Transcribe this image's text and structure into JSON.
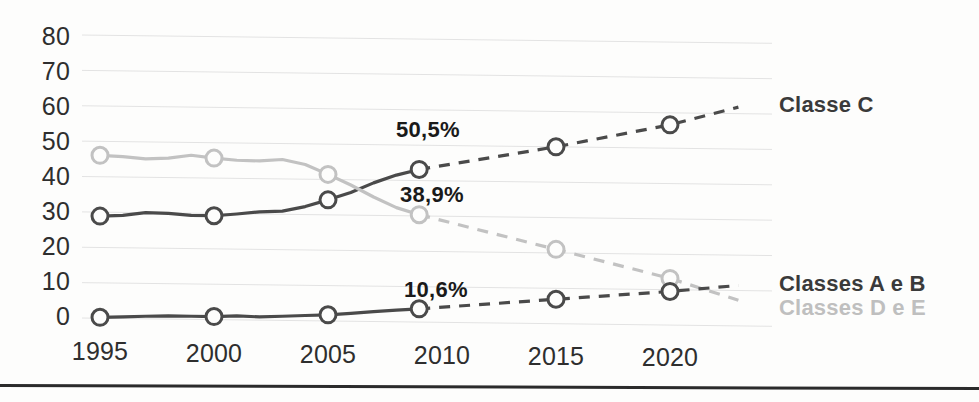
{
  "chart_data": {
    "type": "line",
    "title": "",
    "subtitle": "",
    "xlabel": "",
    "ylabel": "",
    "xlim": [
      1994,
      2024
    ],
    "ylim": [
      0,
      80
    ],
    "grid": true,
    "legend_position": "right",
    "x_tick_labels": [
      "1995",
      "2000",
      "2005",
      "2010",
      "2015",
      "2020"
    ],
    "x_ticks": [
      1995,
      2000,
      2005,
      2010,
      2015,
      2020
    ],
    "y_tick_labels": [
      "0",
      "10",
      "20",
      "30",
      "40",
      "50",
      "60",
      "70",
      "80"
    ],
    "y_ticks": [
      0,
      10,
      20,
      30,
      40,
      50,
      60,
      70,
      80
    ],
    "series": [
      {
        "name": "Classe C",
        "color": "#4a4a4a",
        "style": "solid-then-dashed",
        "solid_x": [
          1995,
          1996,
          1997,
          1998,
          1999,
          2000,
          2001,
          2002,
          2003,
          2004,
          2005,
          2006,
          2007,
          2008,
          2009
        ],
        "solid_y": [
          28.8,
          29.0,
          29.8,
          29.6,
          29.0,
          28.9,
          29.4,
          30.0,
          30.2,
          31.5,
          33.4,
          35.5,
          38.2,
          40.4,
          42.0
        ],
        "dashed_x": [
          2009,
          2015,
          2020,
          2023
        ],
        "dashed_y": [
          42.0,
          48.4,
          54.6,
          59.6
        ],
        "marker_x": [
          1995,
          2000,
          2005,
          2009,
          2015,
          2020
        ],
        "marker_y": [
          28.8,
          28.9,
          33.4,
          42.0,
          48.4,
          54.6
        ]
      },
      {
        "name": "Classes D e E",
        "color": "#c2c2c2",
        "style": "solid-then-dashed",
        "solid_x": [
          1995,
          1996,
          1997,
          1998,
          1999,
          2000,
          2001,
          2002,
          2003,
          2004,
          2005,
          2006,
          2007,
          2008,
          2009
        ],
        "solid_y": [
          46.0,
          45.6,
          45.0,
          45.2,
          46.0,
          45.2,
          44.6,
          44.4,
          44.8,
          43.4,
          40.6,
          37.6,
          34.2,
          31.2,
          29.2
        ],
        "dashed_x": [
          2009,
          2015,
          2020,
          2023
        ],
        "dashed_y": [
          29.2,
          19.4,
          11.2,
          5.0
        ],
        "marker_x": [
          1995,
          2000,
          2005,
          2009,
          2015,
          2020
        ],
        "marker_y": [
          46.0,
          45.2,
          40.6,
          29.2,
          19.4,
          11.2
        ]
      },
      {
        "name": "Classes A e B",
        "color": "#4a4a4a",
        "style": "solid-then-dashed",
        "solid_x": [
          1995,
          1996,
          1997,
          1998,
          1999,
          2000,
          2001,
          2002,
          2003,
          2004,
          2005,
          2006,
          2007,
          2008,
          2009
        ],
        "solid_y": [
          0.2,
          0.3,
          0.5,
          0.6,
          0.5,
          0.4,
          0.6,
          0.3,
          0.5,
          0.7,
          0.9,
          1.3,
          1.8,
          2.2,
          2.6
        ],
        "dashed_x": [
          2009,
          2015,
          2020,
          2023
        ],
        "dashed_y": [
          2.6,
          5.3,
          7.5,
          9.2
        ],
        "marker_x": [
          1995,
          2000,
          2005,
          2009,
          2015,
          2020
        ],
        "marker_y": [
          0.2,
          0.4,
          0.9,
          2.6,
          5.3,
          7.5
        ]
      }
    ],
    "annotations": [
      {
        "text": "50,5%",
        "series": "Classe C",
        "x": 2010.2,
        "y": 50.5
      },
      {
        "text": "38,9%",
        "series": "Classes D e E",
        "x": 2010.2,
        "y": 38.9
      },
      {
        "text": "10,6%",
        "series": "Classes A e B",
        "x": 2010.2,
        "y": 10.6
      }
    ],
    "legend": [
      {
        "label": "Classe C",
        "color": "#3a3a3a"
      },
      {
        "label": "Classes A e B",
        "color": "#3a3a3a"
      },
      {
        "label": "Classes D e E",
        "color": "#bfbfbf"
      }
    ]
  },
  "colors": {
    "background": "#fdfdfc",
    "gridline": "#e3e3e3",
    "tick_text": "#2e2e2e",
    "label_text": "#1a1a1a",
    "series_dark": "#4a4a4a",
    "series_light": "#c2c2c2",
    "bottom_rule": "#2b2b2b"
  },
  "axis": {
    "y_labels": [
      "80",
      "70",
      "60",
      "50",
      "40",
      "30",
      "20",
      "10",
      "0"
    ],
    "x_labels": [
      "1995",
      "2000",
      "2005",
      "2010",
      "2015",
      "2020"
    ]
  },
  "annotation_labels": {
    "classe_c": "50,5%",
    "classes_de": "38,9%",
    "classes_ab": "10,6%"
  },
  "legend_labels": {
    "classe_c": "Classe C",
    "classes_ab": "Classes A e B",
    "classes_de": "Classes D e E"
  }
}
